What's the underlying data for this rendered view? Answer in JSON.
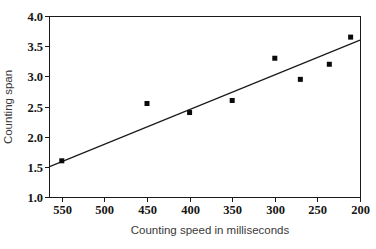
{
  "chart_data": {
    "type": "scatter",
    "title": "",
    "xlabel": "Counting speed in milliseconds",
    "ylabel": "Counting span",
    "x_axis_reversed": true,
    "xlim": [
      565,
      200
    ],
    "ylim": [
      1.0,
      4.0
    ],
    "x_ticks": [
      550,
      500,
      450,
      400,
      350,
      300,
      250,
      200
    ],
    "y_ticks": [
      1.0,
      1.5,
      2.0,
      2.5,
      3.0,
      3.5,
      4.0
    ],
    "grid": false,
    "legend": "none",
    "marker": "filled-square",
    "points": [
      {
        "x": 550,
        "y": 1.6
      },
      {
        "x": 450,
        "y": 2.55
      },
      {
        "x": 400,
        "y": 2.4
      },
      {
        "x": 350,
        "y": 2.6
      },
      {
        "x": 300,
        "y": 3.3
      },
      {
        "x": 270,
        "y": 2.95
      },
      {
        "x": 236,
        "y": 3.2
      },
      {
        "x": 211,
        "y": 3.65
      }
    ],
    "trend_line": {
      "x1": 565,
      "y1": 1.5,
      "x2": 200,
      "y2": 3.6
    },
    "colors": {
      "background": "#ffffff",
      "marker": "#0a0a0a",
      "trend_line": "#1a1a1a",
      "frame": "#1a1a1a",
      "tick_label": "#151515",
      "axis_title": "#3a3a3a"
    }
  }
}
